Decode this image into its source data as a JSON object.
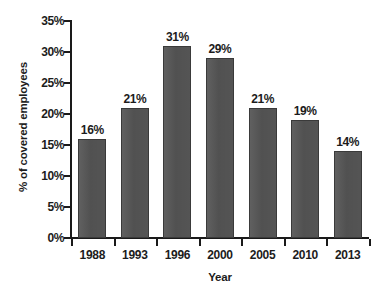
{
  "chart_data": {
    "type": "bar",
    "title": "",
    "subtitle": "",
    "xlabel": "Year",
    "ylabel": "% of covered employees",
    "categories": [
      "1988",
      "1993",
      "1996",
      "2000",
      "2005",
      "2010",
      "2013"
    ],
    "values": [
      16,
      21,
      31,
      29,
      21,
      19,
      14
    ],
    "data_labels": [
      "16%",
      "21%",
      "31%",
      "29%",
      "21%",
      "19%",
      "14%"
    ],
    "series": [
      {
        "name": "% of covered employees",
        "values": [
          16,
          21,
          31,
          29,
          21,
          19,
          14
        ]
      }
    ],
    "ylim": [
      0,
      35
    ],
    "ytick_values": [
      0,
      5,
      10,
      15,
      20,
      25,
      30,
      35
    ],
    "ytick_labels": [
      "0%",
      "5%",
      "10%",
      "15%",
      "20%",
      "25%",
      "30%",
      "35%"
    ],
    "xtick_labels": [
      "1988",
      "1993",
      "1996",
      "2000",
      "2005",
      "2010",
      "2013"
    ],
    "grid": false,
    "legend": false,
    "legend_position": "none",
    "annotations": [],
    "colors": {
      "bar_fill": "#565656",
      "bar_edge": "#3a3a3a",
      "axis": "#1a1a1a",
      "text": "#1c1c1c",
      "background": "#ffffff"
    }
  }
}
